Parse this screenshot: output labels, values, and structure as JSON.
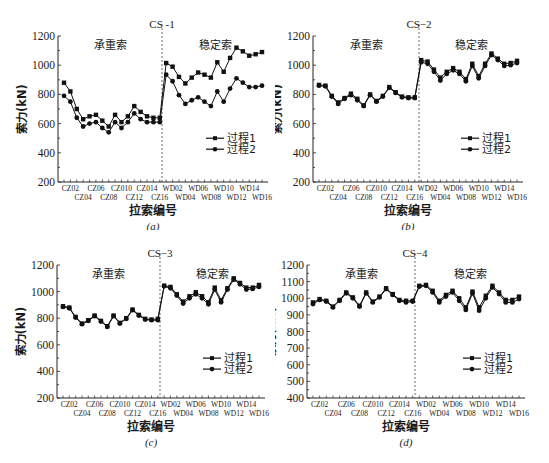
{
  "chart_data": [
    {
      "id": "a",
      "type": "line",
      "title": "CS -1",
      "caption": "(a)",
      "xlabel": "拉索编号",
      "ylabel": "索力(kN)",
      "ylim": [
        200,
        1200
      ],
      "yticks": [
        200,
        400,
        600,
        800,
        1000,
        1200
      ],
      "region_labels": {
        "left": "承重索",
        "right": "稳定索"
      },
      "categories": [
        "CZ01",
        "CZ02",
        "CZ03",
        "CZ04",
        "CZ05",
        "CZ06",
        "CZ07",
        "CZ08",
        "CZ09",
        "CZ010",
        "CZ11",
        "CZ12",
        "CZ13",
        "CZ014",
        "CZ15",
        "CZ16",
        "WD01",
        "WD02",
        "WD03",
        "WD04",
        "WD05",
        "WD06",
        "WD07",
        "WD08",
        "WD09",
        "WD10",
        "WD11",
        "WD12",
        "WD13",
        "WD14",
        "WD15",
        "WD16"
      ],
      "tick_labels_top": [
        "CZ02",
        "CZ06",
        "CZ010",
        "CZ014",
        "WD02",
        "WD06",
        "WD10",
        "WD14"
      ],
      "tick_labels_bottom": [
        "CZ04",
        "CZ08",
        "CZ12",
        "CZ16",
        "WD04",
        "WD08",
        "WD12",
        "WD16"
      ],
      "series": [
        {
          "name": "过程1",
          "marker": "square",
          "values": [
            880,
            820,
            700,
            630,
            650,
            660,
            620,
            580,
            660,
            610,
            650,
            720,
            680,
            650,
            640,
            640,
            1015,
            990,
            920,
            875,
            915,
            950,
            935,
            915,
            1020,
            955,
            1050,
            1120,
            1095,
            1065,
            1075,
            1090
          ]
        },
        {
          "name": "过程2",
          "marker": "circle",
          "values": [
            790,
            750,
            640,
            580,
            600,
            610,
            570,
            540,
            610,
            570,
            610,
            670,
            630,
            610,
            610,
            610,
            935,
            890,
            795,
            735,
            760,
            780,
            750,
            720,
            820,
            750,
            840,
            910,
            880,
            850,
            850,
            860
          ]
        }
      ],
      "legend_position": "right-middle",
      "grid": false
    },
    {
      "id": "b",
      "type": "line",
      "title": "CS−2",
      "caption": "(b)",
      "xlabel": "拉索编号",
      "ylabel": "索力(kN)",
      "ylim": [
        200,
        1200
      ],
      "yticks": [
        200,
        400,
        600,
        800,
        1000,
        1200
      ],
      "region_labels": {
        "left": "承重索",
        "right": "稳定索"
      },
      "categories": [
        "CZ01",
        "CZ02",
        "CZ03",
        "CZ04",
        "CZ05",
        "CZ06",
        "CZ07",
        "CZ08",
        "CZ09",
        "CZ010",
        "CZ11",
        "CZ12",
        "CZ13",
        "CZ014",
        "CZ15",
        "CZ16",
        "WD01",
        "WD02",
        "WD03",
        "WD04",
        "WD05",
        "WD06",
        "WD07",
        "WD08",
        "WD09",
        "WD10",
        "WD11",
        "WD12",
        "WD13",
        "WD14",
        "WD15",
        "WD16"
      ],
      "tick_labels_top": [
        "CZ02",
        "CZ06",
        "CZ010",
        "CZ014",
        "WD02",
        "WD06",
        "WD10",
        "WD14"
      ],
      "tick_labels_bottom": [
        "CZ04",
        "CZ08",
        "CZ12",
        "CZ16",
        "WD04",
        "WD08",
        "WD12",
        "WD16"
      ],
      "series": [
        {
          "name": "过程1",
          "marker": "square",
          "values": [
            865,
            860,
            790,
            745,
            775,
            805,
            770,
            725,
            800,
            755,
            790,
            850,
            815,
            785,
            780,
            780,
            1035,
            1025,
            970,
            915,
            955,
            980,
            955,
            905,
            1010,
            925,
            1010,
            1080,
            1045,
            1010,
            1015,
            1030
          ]
        },
        {
          "name": "过程2",
          "marker": "circle",
          "values": [
            860,
            855,
            785,
            735,
            770,
            795,
            760,
            720,
            795,
            750,
            785,
            845,
            810,
            780,
            775,
            775,
            1020,
            1010,
            955,
            895,
            940,
            965,
            940,
            890,
            995,
            910,
            995,
            1070,
            1035,
            995,
            1000,
            1015
          ]
        }
      ],
      "legend_position": "right-middle",
      "grid": false
    },
    {
      "id": "c",
      "type": "line",
      "title": "CS−3",
      "caption": "(c)",
      "xlabel": "拉索编号",
      "ylabel": "索力(kN)",
      "ylim": [
        200,
        1200
      ],
      "yticks": [
        200,
        400,
        600,
        800,
        1000,
        1200
      ],
      "region_labels": {
        "left": "承重索",
        "right": "稳定索"
      },
      "categories": [
        "CZ01",
        "CZ02",
        "CZ03",
        "CZ04",
        "CZ05",
        "CZ06",
        "CZ07",
        "CZ08",
        "CZ09",
        "CZ010",
        "CZ11",
        "CZ12",
        "CZ13",
        "CZ014",
        "CZ15",
        "CZ16",
        "WD01",
        "WD02",
        "WD03",
        "WD04",
        "WD05",
        "WD06",
        "WD07",
        "WD08",
        "WD09",
        "WD10",
        "WD11",
        "WD12",
        "WD13",
        "WD14",
        "WD15",
        "WD16"
      ],
      "tick_labels_top": [
        "CZ02",
        "CZ06",
        "CZ010",
        "CZ014",
        "WD02",
        "WD06",
        "WD10",
        "WD14"
      ],
      "tick_labels_bottom": [
        "CZ04",
        "CZ08",
        "CZ12",
        "CZ16",
        "WD04",
        "WD08",
        "WD12",
        "WD16"
      ],
      "series": [
        {
          "name": "过程1",
          "marker": "square",
          "values": [
            890,
            880,
            810,
            760,
            785,
            820,
            780,
            740,
            820,
            765,
            800,
            865,
            825,
            795,
            790,
            795,
            1045,
            1035,
            980,
            925,
            965,
            995,
            965,
            920,
            1030,
            935,
            1025,
            1100,
            1065,
            1030,
            1030,
            1050
          ]
        },
        {
          "name": "过程2",
          "marker": "circle",
          "values": [
            885,
            875,
            805,
            755,
            780,
            815,
            775,
            735,
            815,
            760,
            795,
            860,
            820,
            790,
            785,
            785,
            1040,
            1025,
            970,
            910,
            950,
            980,
            950,
            905,
            1015,
            920,
            1015,
            1090,
            1055,
            1015,
            1020,
            1035
          ]
        }
      ],
      "legend_position": "right-middle",
      "grid": false
    },
    {
      "id": "d",
      "type": "line",
      "title": "CS−4",
      "caption": "(d)",
      "xlabel": "拉索编号",
      "ylabel": "索力(kN)",
      "ylim": [
        400,
        1200
      ],
      "yticks": [
        400,
        500,
        600,
        700,
        800,
        900,
        1000,
        1100,
        1200
      ],
      "region_labels": {
        "left": "承重索",
        "right": "稳定索"
      },
      "categories": [
        "CZ01",
        "CZ02",
        "CZ03",
        "CZ04",
        "CZ05",
        "CZ06",
        "CZ07",
        "CZ08",
        "CZ09",
        "CZ010",
        "CZ11",
        "CZ12",
        "CZ13",
        "CZ014",
        "CZ15",
        "CZ16",
        "WD01",
        "WD02",
        "WD03",
        "WD04",
        "WD05",
        "WD06",
        "WD07",
        "WD08",
        "WD09",
        "WD10",
        "WD11",
        "WD12",
        "WD13",
        "WD14",
        "WD15",
        "WD16"
      ],
      "tick_labels_top": [
        "CZ02",
        "CZ06",
        "CZ010",
        "CZ014",
        "WD02",
        "WD06",
        "WD10",
        "WD14"
      ],
      "tick_labels_bottom": [
        "CZ04",
        "CZ08",
        "CZ12",
        "CZ16",
        "WD04",
        "WD08",
        "WD12",
        "WD16"
      ],
      "series": [
        {
          "name": "过程1",
          "marker": "square",
          "values": [
            975,
            995,
            985,
            950,
            990,
            1035,
            1005,
            955,
            1035,
            980,
            1010,
            1060,
            1025,
            990,
            985,
            985,
            1075,
            1080,
            1045,
            985,
            1020,
            1045,
            1000,
            945,
            1040,
            945,
            1015,
            1075,
            1035,
            990,
            990,
            1010
          ]
        },
        {
          "name": "过程2",
          "marker": "circle",
          "values": [
            965,
            990,
            980,
            945,
            985,
            1030,
            1000,
            950,
            1030,
            975,
            1005,
            1055,
            1020,
            985,
            975,
            980,
            1070,
            1075,
            1035,
            975,
            1010,
            1035,
            985,
            930,
            1030,
            925,
            1000,
            1065,
            1025,
            975,
            975,
            995
          ]
        }
      ],
      "legend_position": "right-middle",
      "grid": false
    }
  ]
}
